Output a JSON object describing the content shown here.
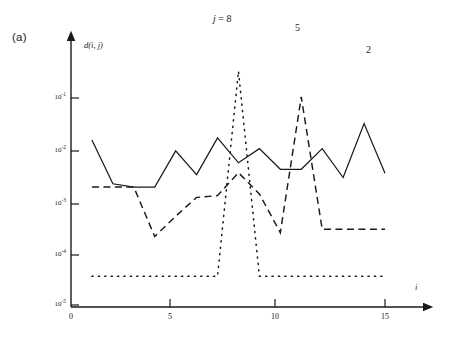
{
  "panel": {
    "label": "(a)"
  },
  "axes": {
    "y_axis_label": "d(i, j)",
    "x_axis_label": "i",
    "y_ticks": [
      {
        "mantissa": "10",
        "exponent": "-1",
        "value": 0.1
      },
      {
        "mantissa": "10",
        "exponent": "-2",
        "value": 0.01
      },
      {
        "mantissa": "10",
        "exponent": "-3",
        "value": 0.001
      },
      {
        "mantissa": "10",
        "exponent": "-4",
        "value": 0.0001
      },
      {
        "mantissa": "10",
        "exponent": "-5",
        "value": 1e-05
      }
    ],
    "x_ticks": [
      "0",
      "5",
      "10",
      "15"
    ]
  },
  "annotations": [
    {
      "name": "j-equals-8",
      "prefix": "j",
      "text": " = 8",
      "series": "dotted"
    },
    {
      "name": "series-5",
      "text": "5",
      "series": "dashed"
    },
    {
      "name": "series-2",
      "text": "2",
      "series": "solid"
    }
  ],
  "colors": {
    "ink": "#1a1a1a",
    "background": "#ffffff"
  },
  "chart_data": {
    "type": "line",
    "title": "",
    "xlabel": "i",
    "ylabel": "d(i, j)",
    "yscale": "log",
    "xscale": "linear",
    "xlim": [
      0,
      16.2
    ],
    "ylim": [
      1e-05,
      0.4
    ],
    "grid": false,
    "legend": "inline-annotations",
    "x": [
      1,
      2,
      3,
      4,
      5,
      6,
      7,
      8,
      9,
      10,
      11,
      12,
      13,
      14,
      15
    ],
    "series": [
      {
        "name": "2",
        "label": "2",
        "style": "solid",
        "values": [
          0.0155,
          0.0022,
          0.0019,
          0.0019,
          0.0095,
          0.0033,
          0.017,
          0.0056,
          0.0105,
          0.0042,
          0.0042,
          0.0105,
          0.0029,
          0.032,
          0.0035
        ]
      },
      {
        "name": "5",
        "label": "5",
        "style": "dashed",
        "values": [
          0.0019,
          0.0019,
          0.0019,
          0.00021,
          0.00052,
          0.0012,
          0.0013,
          0.0036,
          0.0014,
          0.00025,
          0.105,
          0.00029,
          0.00029,
          0.00029,
          0.00029
        ]
      },
      {
        "name": "8",
        "label": "j = 8",
        "style": "dotted",
        "values": [
          3.6e-05,
          3.6e-05,
          3.6e-05,
          3.6e-05,
          3.6e-05,
          3.6e-05,
          3.6e-05,
          0.33,
          3.6e-05,
          3.6e-05,
          3.6e-05,
          3.6e-05,
          3.6e-05,
          3.6e-05,
          3.6e-05
        ]
      }
    ]
  }
}
